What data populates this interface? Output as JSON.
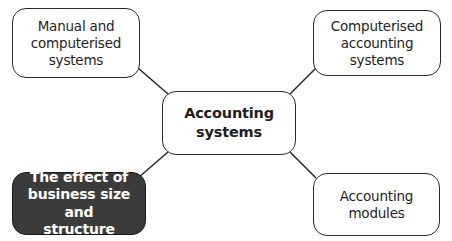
{
  "diagram": {
    "type": "mind-map",
    "center": {
      "label": "Accounting systems",
      "lines": [
        "Accounting",
        "systems"
      ]
    },
    "nodes": [
      {
        "id": "manual-computerised",
        "position": "top-left",
        "label": "Manual and computerised systems",
        "lines": [
          "Manual and",
          "computerised",
          "systems"
        ],
        "highlighted": false
      },
      {
        "id": "computerised-accounting",
        "position": "top-right",
        "label": "Computerised accounting systems",
        "lines": [
          "Computerised",
          "accounting",
          "systems"
        ],
        "highlighted": false
      },
      {
        "id": "business-size-structure",
        "position": "bottom-left",
        "label": "The effect of business size and structure",
        "lines": [
          "The effect of",
          "business size and",
          "structure"
        ],
        "highlighted": true
      },
      {
        "id": "accounting-modules",
        "position": "bottom-right",
        "label": "Accounting modules",
        "lines": [
          "Accounting",
          "modules"
        ],
        "highlighted": false
      }
    ],
    "colors": {
      "background": "#ffffff",
      "border": "#2b2b2b",
      "text": "#1e1e1e",
      "highlight_fill": "#3b3b3b",
      "highlight_text": "#ffffff",
      "connector": "#2b2b2b"
    }
  }
}
